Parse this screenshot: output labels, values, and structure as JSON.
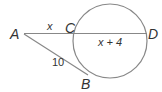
{
  "diagram": {
    "type": "geometry-secant-tangent",
    "points": [
      {
        "name": "A",
        "label": "A"
      },
      {
        "name": "B",
        "label": "B"
      },
      {
        "name": "C",
        "label": "C"
      },
      {
        "name": "D",
        "label": "D"
      }
    ],
    "segments": {
      "AC": {
        "label": "x"
      },
      "CD": {
        "label": "x + 4"
      },
      "AB": {
        "label": "10"
      }
    },
    "colors": {
      "stroke": "#888888",
      "text": "#333333"
    }
  }
}
